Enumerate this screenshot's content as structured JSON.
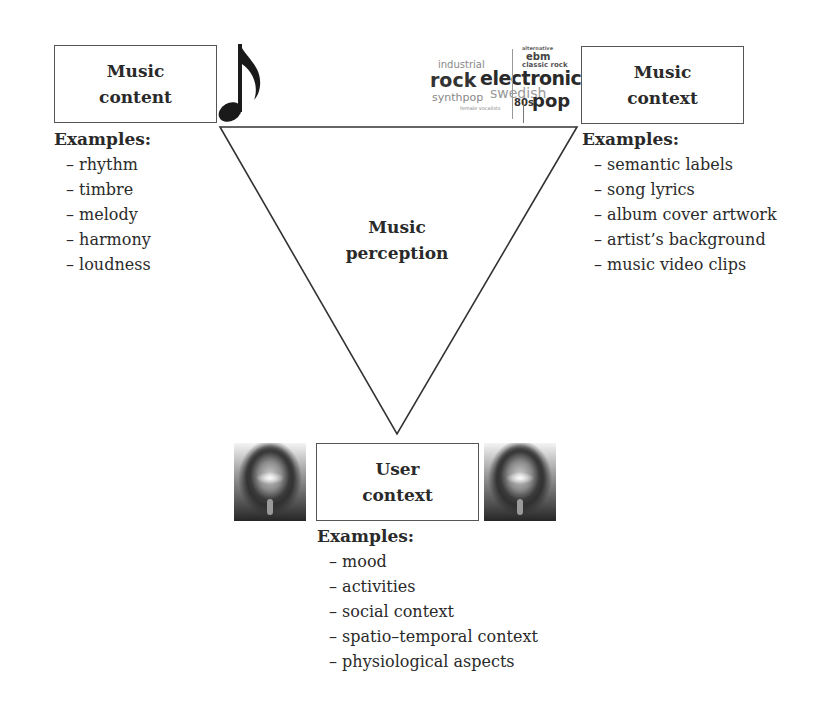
{
  "diagram": {
    "center": {
      "line1": "Music",
      "line2": "perception"
    },
    "nodes": {
      "music_content": {
        "line1": "Music",
        "line2": "content",
        "icon": "music-note-icon",
        "examples_header": "Examples:",
        "examples": [
          "rhythm",
          "timbre",
          "melody",
          "harmony",
          "loudness"
        ]
      },
      "music_context": {
        "line1": "Music",
        "line2": "context",
        "icon": "tag-cloud-icon",
        "tag_cloud": [
          "alternative",
          "ebm",
          "industrial",
          "classic rock",
          "rock",
          "electronic",
          "swedish",
          "synthpop",
          "80s",
          "pop",
          "female vocalists"
        ],
        "examples_header": "Examples:",
        "examples": [
          "semantic labels",
          "song lyrics",
          "album cover artwork",
          "artist’s background",
          "music video clips"
        ]
      },
      "user_context": {
        "line1": "User",
        "line2": "context",
        "icon": "user-head-icon",
        "examples_header": "Examples:",
        "examples": [
          "mood",
          "activities",
          "social context",
          "spatio–temporal context",
          "physiological aspects"
        ]
      }
    }
  }
}
